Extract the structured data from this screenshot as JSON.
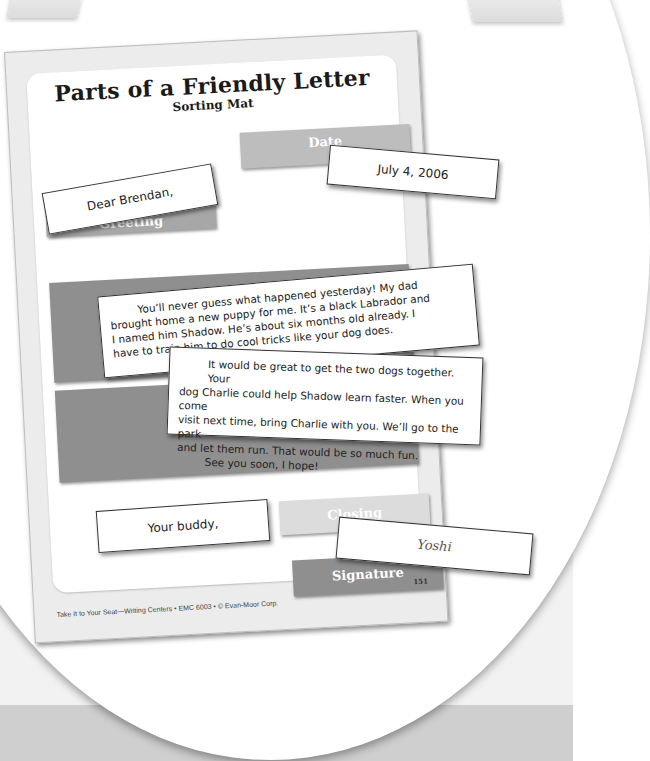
{
  "worksheet": {
    "title": "Parts of a Friendly Letter",
    "subtitle": "Sorting Mat",
    "slots": {
      "date": "Date",
      "greeting": "Greeting",
      "body": "",
      "closing": "Closing",
      "signature": "Signature"
    },
    "footer": "Take It to Your Seat—Writing Centers • EMC 6003 • © Evan-Moor Corp.",
    "page_number": "151"
  },
  "cards": {
    "greeting": "Dear Brendan,",
    "date": "July 4, 2006",
    "body1": [
      "You’ll never guess what happened yesterday! My dad",
      "brought home a new puppy for me. It’s a black Labrador and",
      "I named him Shadow. He’s about six months old already. I",
      "have to train him to do cool tricks like your dog does."
    ],
    "body2": [
      "It would be great to get the two dogs together. Your",
      "dog Charlie could help Shadow learn faster. When you come",
      "visit next time, bring Charlie with you. We’ll go to the park",
      "and let them run. That would be so much fun.",
      "See you soon, I hope!"
    ],
    "closing": "Your buddy,",
    "signature": "Yoshi"
  },
  "colors": {
    "slot_light": "#bdbdbd",
    "slot_lighter": "#dcdcdc",
    "slot_dark": "#8f8f8f",
    "background_band": "#cfcfcf"
  }
}
